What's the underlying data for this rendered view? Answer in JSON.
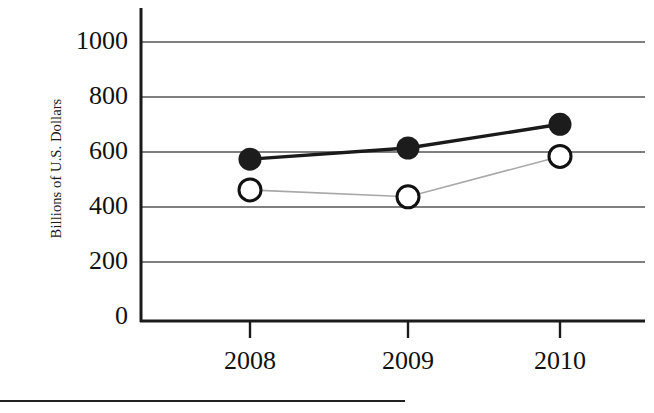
{
  "chart_data": {
    "type": "line",
    "title": "",
    "xlabel": "",
    "ylabel": "Billions of U.S. Dollars",
    "categories": [
      "2008",
      "2009",
      "2010"
    ],
    "x_tick_labels": [
      "2008",
      "2009",
      "2010"
    ],
    "y_tick_labels": [
      "0",
      "200",
      "400",
      "600",
      "800",
      "1000"
    ],
    "y_ticks": [
      0,
      200,
      400,
      600,
      800,
      1000
    ],
    "ylim": [
      0,
      1080
    ],
    "grid": "horizontal",
    "legend": "none",
    "series": [
      {
        "name": "filled-circle-series",
        "marker": "filled-circle",
        "line_style": "thick-solid-black",
        "color": "#1a1a1a",
        "values": [
          580,
          620,
          705
        ]
      },
      {
        "name": "open-circle-series",
        "marker": "open-circle",
        "line_style": "thin-solid-gray",
        "color": "#9a9a9a",
        "values": [
          470,
          445,
          590
        ]
      }
    ]
  },
  "axis": {
    "y_label": "Billions of U.S. Dollars",
    "tick_0": "0",
    "tick_200": "200",
    "tick_400": "400",
    "tick_600": "600",
    "tick_800": "800",
    "tick_1000": "1000",
    "x_2008": "2008",
    "x_2009": "2009",
    "x_2010": "2010"
  },
  "colors": {
    "axis": "#1a1a1a",
    "gridline": "#555555",
    "series_filled": "#1a1a1a",
    "series_open_line": "#a8a8a8",
    "marker_open_fill": "#ffffff",
    "footer_rule": "#222222",
    "background": "#ffffff"
  }
}
